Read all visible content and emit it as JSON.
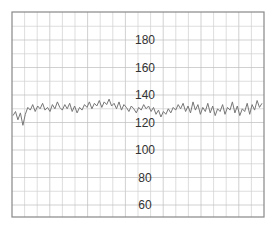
{
  "chart_data": {
    "type": "line",
    "title": "",
    "xlabel": "",
    "ylabel": "",
    "ylim": [
      50,
      190
    ],
    "grid": true,
    "legend": null,
    "y_ticks": [
      180,
      160,
      140,
      120,
      100,
      80,
      60
    ],
    "series": [
      {
        "name": "fetal heart rate",
        "color": "#777777",
        "values": [
          125,
          128,
          122,
          127,
          118,
          126,
          131,
          129,
          133,
          128,
          132,
          130,
          134,
          129,
          131,
          128,
          133,
          130,
          135,
          131,
          129,
          133,
          130,
          134,
          128,
          132,
          127,
          131,
          129,
          133,
          131,
          135,
          130,
          134,
          132,
          136,
          131,
          135,
          133,
          137,
          132,
          134,
          130,
          135,
          129,
          133,
          131,
          128,
          132,
          130,
          127,
          131,
          129,
          133,
          130,
          132,
          128,
          131,
          126,
          129,
          124,
          128,
          126,
          130,
          127,
          131,
          129,
          133,
          130,
          134,
          128,
          132,
          127,
          135,
          129,
          133,
          126,
          131,
          128,
          134,
          127,
          132,
          125,
          130,
          128,
          133,
          126,
          131,
          129,
          135,
          127,
          132,
          125,
          130,
          128,
          134,
          126,
          133,
          129,
          136,
          131,
          134
        ]
      }
    ],
    "colors": {
      "grid": "#d0d0d0",
      "border": "#888888",
      "trace": "#777777",
      "label": "#333333"
    }
  }
}
